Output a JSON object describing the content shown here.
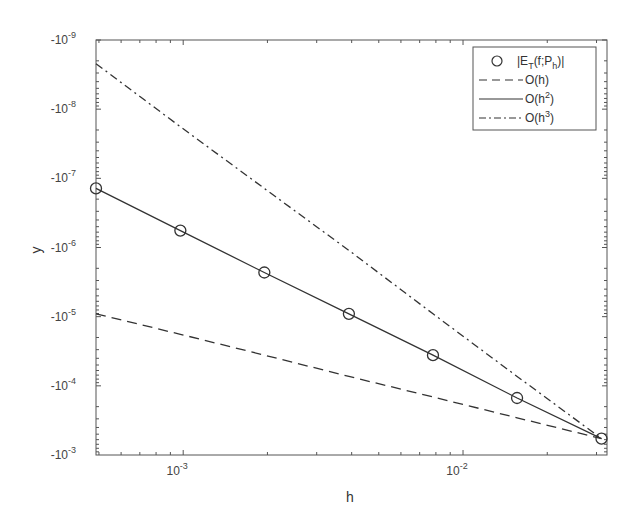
{
  "chart_data": {
    "type": "line",
    "title": "",
    "xlabel": "h",
    "ylabel": "y",
    "xscale": "log",
    "yscale": "log (reversed, negative-labeled)",
    "xlim": [
      0.000488,
      0.0327
    ],
    "ylim_labels": [
      "-10^-9",
      "-10^-3"
    ],
    "x_ticks": [
      {
        "base": "10",
        "exp": "-3",
        "value": 0.001
      },
      {
        "base": "10",
        "exp": "-2",
        "value": 0.01
      }
    ],
    "y_ticks": [
      {
        "base": "-10",
        "exp": "-9",
        "value": 1e-09
      },
      {
        "base": "-10",
        "exp": "-8",
        "value": 1e-08
      },
      {
        "base": "-10",
        "exp": "-7",
        "value": 1e-07
      },
      {
        "base": "-10",
        "exp": "-6",
        "value": 1e-06
      },
      {
        "base": "-10",
        "exp": "-5",
        "value": 1e-05
      },
      {
        "base": "-10",
        "exp": "-4",
        "value": 0.0001
      },
      {
        "base": "-10",
        "exp": "-3",
        "value": 0.001
      }
    ],
    "x": [
      0.000488,
      0.000977,
      0.00195,
      0.00391,
      0.00781,
      0.0156,
      0.03125
    ],
    "series": [
      {
        "name": "|E_T(f;P_h)|",
        "style": "markers",
        "marker": "circle",
        "values": [
          1.4e-07,
          5.7e-07,
          2.3e-06,
          9.1e-06,
          3.6e-05,
          0.00015,
          0.00058
        ]
      },
      {
        "name": "O(h)",
        "style": "dashed",
        "values": [
          9.1e-06,
          1.8e-05,
          3.6e-05,
          7.3e-05,
          0.000145,
          0.00029,
          0.00058
        ]
      },
      {
        "name": "O(h^2)",
        "style": "solid",
        "values": [
          1.4e-07,
          5.7e-07,
          2.3e-06,
          9.1e-06,
          3.6e-05,
          0.00015,
          0.00058
        ]
      },
      {
        "name": "O(h^3)",
        "style": "dash-dot",
        "values": [
          2.2e-09,
          1.8e-08,
          1.4e-07,
          1.1e-06,
          9.1e-06,
          7.3e-05,
          0.00058
        ]
      }
    ],
    "grid": false,
    "legend_position": "top-right"
  },
  "legend": {
    "items": [
      {
        "symbol": "circle",
        "label_main": "|E",
        "label_sub1": "T",
        "label_mid": "(f;P",
        "label_sub2": "h",
        "label_end": ")|"
      },
      {
        "symbol": "dashed",
        "label_main": "O(h)"
      },
      {
        "symbol": "solid",
        "label_main": "O(h",
        "label_sup": "2",
        "label_end": ")"
      },
      {
        "symbol": "dash-dot",
        "label_main": "O(h",
        "label_sup": "3",
        "label_end": ")"
      }
    ]
  },
  "axes": {
    "xlabel": "h",
    "ylabel": "y"
  },
  "colors": {
    "line": "#333333",
    "axis": "#555555",
    "background": "#ffffff"
  }
}
